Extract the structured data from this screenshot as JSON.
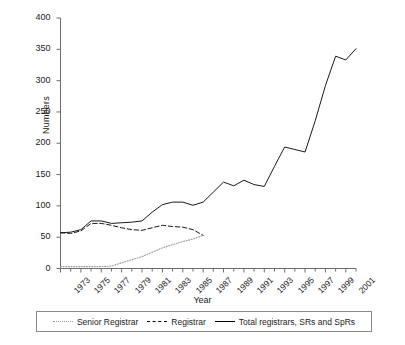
{
  "chart_data": {
    "type": "line",
    "title": "",
    "xlabel": "Year",
    "ylabel": "Numbers",
    "ylim": [
      0,
      400
    ],
    "ytick_step": 50,
    "yticks": [
      0,
      50,
      100,
      150,
      200,
      250,
      300,
      350,
      400
    ],
    "xlim": [
      1973,
      2002
    ],
    "xticks_labeled": [
      1973,
      1975,
      1977,
      1979,
      1981,
      1983,
      1985,
      1987,
      1989,
      1991,
      1993,
      1995,
      1997,
      1999,
      2001
    ],
    "xtick_minor_step": 1,
    "grid": false,
    "legend_position": "bottom",
    "x": [
      1973,
      1974,
      1975,
      1976,
      1977,
      1978,
      1979,
      1980,
      1981,
      1982,
      1983,
      1984,
      1985,
      1986,
      1987,
      1988,
      1989,
      1990,
      1991,
      1992,
      1993,
      1994,
      1995,
      1996,
      1997,
      1998,
      1999,
      2000,
      2001,
      2002
    ],
    "series": [
      {
        "name": "Senior Registrar",
        "style": "dotted",
        "color": "#9a9a9a",
        "x": [
          1973,
          1974,
          1975,
          1976,
          1977,
          1978,
          1979,
          1980,
          1981,
          1982,
          1983,
          1984,
          1985,
          1986,
          1987
        ],
        "values": [
          3,
          3,
          3,
          3,
          3,
          4,
          9,
          14,
          19,
          26,
          33,
          38,
          43,
          47,
          53
        ]
      },
      {
        "name": "Registrar",
        "style": "dashed",
        "color": "#1a1a1a",
        "x": [
          1973,
          1974,
          1975,
          1976,
          1977,
          1978,
          1979,
          1980,
          1981,
          1982,
          1983,
          1984,
          1985,
          1986,
          1987
        ],
        "values": [
          57,
          56,
          60,
          72,
          72,
          69,
          65,
          62,
          61,
          65,
          69,
          67,
          66,
          62,
          53
        ]
      },
      {
        "name": "Total registrars, SRs and SpRs",
        "style": "solid",
        "color": "#1a1a1a",
        "x": [
          1973,
          1974,
          1975,
          1976,
          1977,
          1978,
          1979,
          1980,
          1981,
          1982,
          1983,
          1984,
          1985,
          1986,
          1987,
          1988,
          1989,
          1990,
          1991,
          1992,
          1993,
          1994,
          1995,
          1996,
          1997,
          1998,
          1999,
          2000,
          2001,
          2002
        ],
        "values": [
          57,
          58,
          62,
          76,
          76,
          72,
          73,
          74,
          76,
          90,
          102,
          106,
          106,
          101,
          106,
          122,
          138,
          132,
          141,
          134,
          131,
          163,
          194,
          190,
          186,
          236,
          292,
          339,
          333,
          351
        ]
      }
    ]
  },
  "axes": {
    "y_title": "Numbers",
    "x_title": "Year"
  },
  "legend": {
    "items": [
      {
        "label": "Senior Registrar",
        "swatch": "dotted-line-swatch"
      },
      {
        "label": "Registrar",
        "swatch": "dashed-line-swatch"
      },
      {
        "label": "Total registrars, SRs and SpRs",
        "swatch": "solid-line-swatch"
      }
    ]
  }
}
